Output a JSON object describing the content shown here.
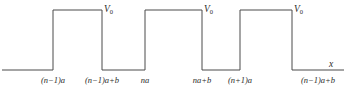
{
  "figure": {
    "kind": "periodic-square-barrier-potential",
    "background_color": "#ffffff",
    "line_color": "#4a4a4a",
    "text_color": "#2b2b2b",
    "axis_label": "x"
  },
  "chart_data": {
    "type": "line",
    "title": "",
    "xlabel": "x",
    "ylabel": "",
    "grid": false,
    "legend": null,
    "xlim": [
      0,
      363
    ],
    "ylim": [
      0,
      92
    ],
    "series": [
      {
        "name": "V(x)",
        "description": "Periodic rectangular potential barriers of height V0 and width b separated by wells of width a-b",
        "x": [
          2,
          53,
          53,
          102,
          102,
          145,
          145,
          202,
          202,
          240,
          240,
          292,
          292,
          344
        ],
        "y": [
          70,
          70,
          10,
          10,
          70,
          70,
          10,
          10,
          70,
          70,
          10,
          10,
          70,
          70
        ]
      }
    ],
    "barriers": [
      {
        "left_px": 53,
        "right_px": 102,
        "top_px": 10,
        "level_label": "V0"
      },
      {
        "left_px": 145,
        "right_px": 202,
        "top_px": 10,
        "level_label": "V0"
      },
      {
        "left_px": 240,
        "right_px": 292,
        "top_px": 10,
        "level_px": 10,
        "level_label": "V0"
      }
    ],
    "baseline_px": 70,
    "potential_height_label": "V0",
    "tick_labels": [
      {
        "text": "(n−1)a",
        "x_px": 53
      },
      {
        "text": "(n−1)a+b",
        "x_px": 102
      },
      {
        "text": "na",
        "x_px": 145
      },
      {
        "text": "na+b",
        "x_px": 202
      },
      {
        "text": "(n+1)a",
        "x_px": 240
      },
      {
        "text": "(n−1)a+b",
        "x_px": 318
      }
    ]
  },
  "labels": {
    "v0_1": "V",
    "v0_1_sub": "0",
    "v0_2": "V",
    "v0_2_sub": "0",
    "v0_3": "V",
    "v0_3_sub": "0",
    "axis_x": "x",
    "tick1": "(n−1)a",
    "tick2": "(n−1)a+b",
    "tick3": "na",
    "tick4": "na+b",
    "tick5": "(n+1)a",
    "tick6": "(n−1)a+b"
  }
}
